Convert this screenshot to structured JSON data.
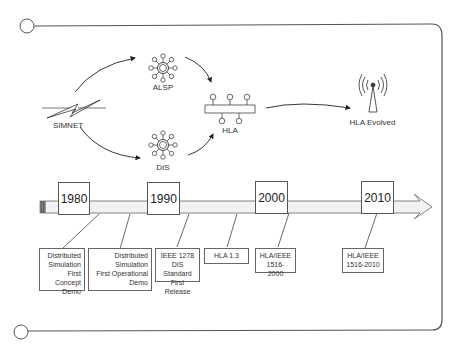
{
  "diagram": {
    "nodes": {
      "simnet": "SIMNET",
      "alsp": "ALSP",
      "dis": "DIS",
      "hla": "HLA",
      "hla_evolved": "HLA Evolved"
    },
    "icons": {
      "simnet": "lightning-network-icon",
      "alsp": "hub-node-icon",
      "dis": "hub-node-icon",
      "hla": "bus-icon",
      "hla_evolved": "antenna-broadcast-icon"
    },
    "timeline": {
      "years": [
        "1980",
        "1990",
        "2000",
        "2010"
      ],
      "events": [
        "Distributed\nSimulation\nFirst Concept\nDemo",
        "Distributed\nSimulation\nFirst Operational\nDemo",
        "IEEE 1278\nDIS Standard\nFirst Release",
        "HLA 1.3",
        "HLA/IEEE\n1516-2000",
        "HLA/IEEE\n1516-2010"
      ]
    },
    "colors": {
      "line": "#555555",
      "bar_fill": "#f2f2f2",
      "text": "#333333"
    }
  }
}
